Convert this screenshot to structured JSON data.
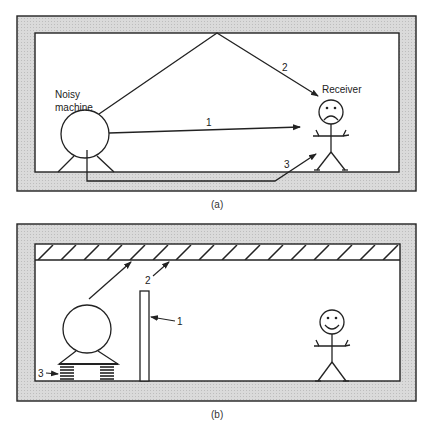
{
  "figure_a": {
    "caption": "(a)",
    "source_label_line1": "Noisy",
    "source_label_line2": "machine",
    "receiver_label": "Receiver",
    "receiver_mood": "sad",
    "paths": [
      {
        "id": "1",
        "label": "1",
        "description": "direct airborne path"
      },
      {
        "id": "2",
        "label": "2",
        "description": "reflected via ceiling"
      },
      {
        "id": "3",
        "label": "3",
        "description": "structure-borne via floor"
      }
    ]
  },
  "figure_b": {
    "caption": "(b)",
    "receiver_mood": "happy",
    "treatments": [
      {
        "id": "1",
        "label": "1",
        "description": "barrier"
      },
      {
        "id": "2",
        "label": "2",
        "description": "absorptive ceiling treatment"
      },
      {
        "id": "3",
        "label": "3",
        "description": "vibration isolation springs"
      }
    ]
  },
  "colors": {
    "wall_fill": "#d6d6d6",
    "line": "#222222",
    "background": "#ffffff"
  }
}
